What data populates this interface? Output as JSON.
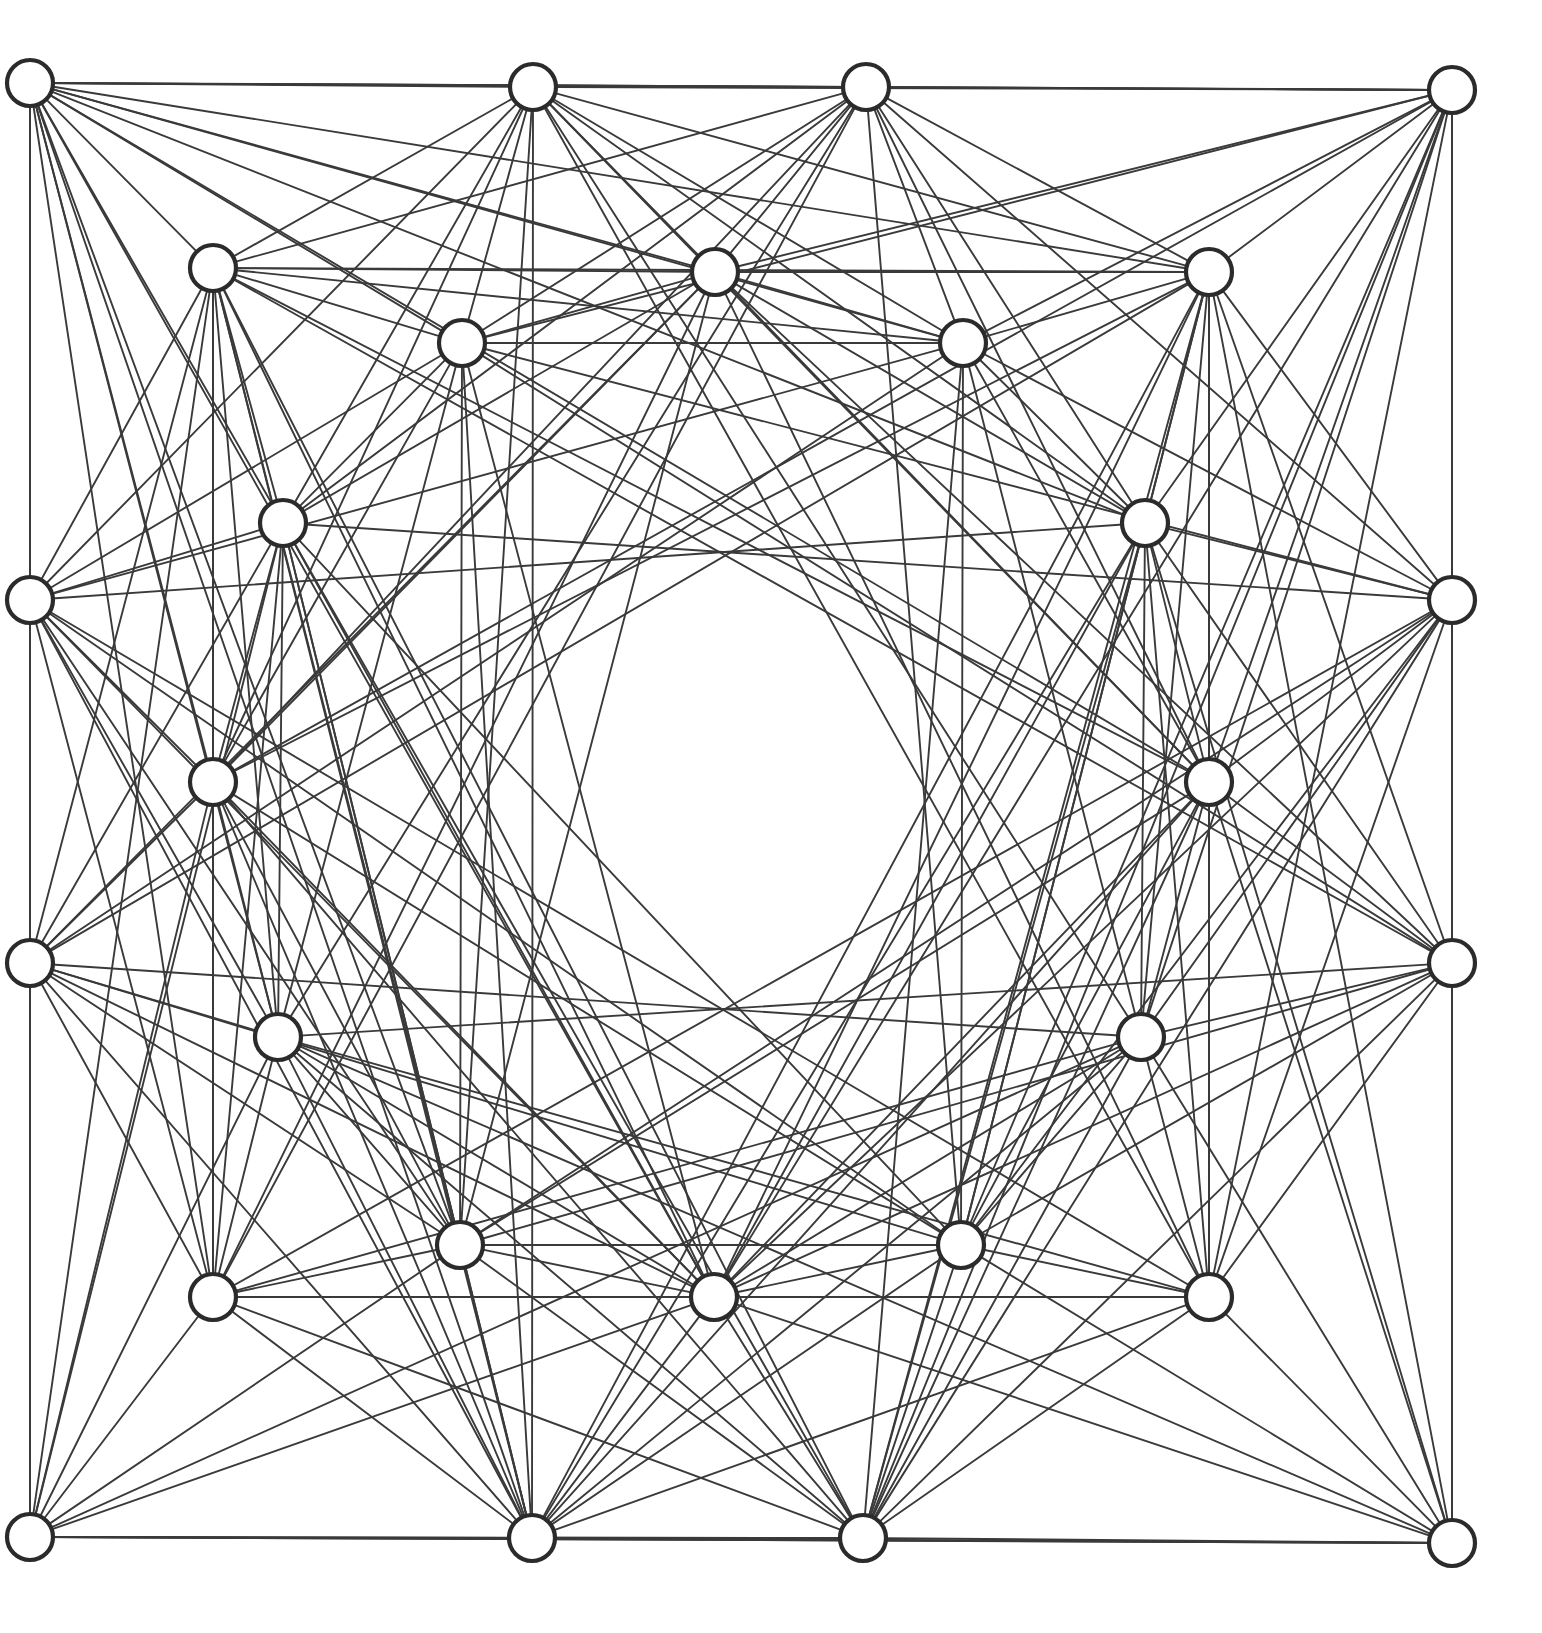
{
  "figure": {
    "canvas": {
      "width": 1542,
      "height": 1633
    },
    "background_color": "#ffffff"
  },
  "style": {
    "edge_color": "#3a3a3a",
    "edge_width": 1.9,
    "node_fill": "#ffffff",
    "node_stroke": "#2b2b2b",
    "node_stroke_width": 4.2,
    "node_radius": 23,
    "boundary_color": "#3a3a3a"
  },
  "chart_data": {
    "type": "scatter",
    "xlabel": "",
    "ylabel": "",
    "xlim": [
      0,
      1542
    ],
    "ylim": [
      0,
      1633
    ],
    "grid": false,
    "legend": "none",
    "node_count": 28,
    "nodes": [
      {
        "id": 0,
        "label": "corner-top-left",
        "x": 30,
        "y": 83,
        "r": 23
      },
      {
        "id": 1,
        "label": "top-edge-left",
        "x": 533,
        "y": 87,
        "r": 23
      },
      {
        "id": 2,
        "label": "top-edge-right",
        "x": 866,
        "y": 87,
        "r": 23
      },
      {
        "id": 3,
        "label": "corner-top-right",
        "x": 1452,
        "y": 90,
        "r": 23
      },
      {
        "id": 4,
        "label": "inner-tl-upper",
        "x": 213,
        "y": 268,
        "r": 23
      },
      {
        "id": 5,
        "label": "inner-top-left-mid",
        "x": 715,
        "y": 272,
        "r": 23
      },
      {
        "id": 6,
        "label": "inner-tr-upper",
        "x": 1209,
        "y": 272,
        "r": 23
      },
      {
        "id": 7,
        "label": "inner-top-left-low",
        "x": 462,
        "y": 343,
        "r": 23
      },
      {
        "id": 8,
        "label": "inner-top-right-low",
        "x": 963,
        "y": 343,
        "r": 23
      },
      {
        "id": 9,
        "label": "mid-upper-left",
        "x": 283,
        "y": 523,
        "r": 23
      },
      {
        "id": 10,
        "label": "mid-upper-right",
        "x": 1145,
        "y": 523,
        "r": 23
      },
      {
        "id": 11,
        "label": "left-edge-upper",
        "x": 30,
        "y": 600,
        "r": 23
      },
      {
        "id": 12,
        "label": "right-edge-upper",
        "x": 1452,
        "y": 600,
        "r": 23
      },
      {
        "id": 13,
        "label": "mid-left",
        "x": 213,
        "y": 782,
        "r": 23
      },
      {
        "id": 14,
        "label": "mid-right",
        "x": 1209,
        "y": 782,
        "r": 23
      },
      {
        "id": 15,
        "label": "left-edge-lower",
        "x": 30,
        "y": 963,
        "r": 23
      },
      {
        "id": 16,
        "label": "right-edge-lower",
        "x": 1452,
        "y": 963,
        "r": 23
      },
      {
        "id": 17,
        "label": "mid-lower-left",
        "x": 278,
        "y": 1037,
        "r": 23
      },
      {
        "id": 18,
        "label": "mid-lower-right",
        "x": 1141,
        "y": 1037,
        "r": 23
      },
      {
        "id": 19,
        "label": "inner-bottom-left",
        "x": 460,
        "y": 1245,
        "r": 23
      },
      {
        "id": 20,
        "label": "inner-bottom-right",
        "x": 961,
        "y": 1245,
        "r": 23
      },
      {
        "id": 21,
        "label": "inner-bl-lower",
        "x": 213,
        "y": 1297,
        "r": 23
      },
      {
        "id": 22,
        "label": "inner-bottom-mid",
        "x": 714,
        "y": 1297,
        "r": 23
      },
      {
        "id": 23,
        "label": "inner-br-lower",
        "x": 1209,
        "y": 1297,
        "r": 23
      },
      {
        "id": 24,
        "label": "corner-bottom-left",
        "x": 30,
        "y": 1537,
        "r": 23
      },
      {
        "id": 25,
        "label": "bottom-edge-left",
        "x": 532,
        "y": 1538,
        "r": 23
      },
      {
        "id": 26,
        "label": "bottom-edge-right",
        "x": 863,
        "y": 1538,
        "r": 23
      },
      {
        "id": 27,
        "label": "corner-bottom-right",
        "x": 1452,
        "y": 1543,
        "r": 23
      }
    ],
    "edges": [
      [
        0,
        1
      ],
      [
        0,
        2
      ],
      [
        0,
        3
      ],
      [
        0,
        4
      ],
      [
        0,
        5
      ],
      [
        0,
        7
      ],
      [
        0,
        9
      ],
      [
        0,
        11
      ],
      [
        0,
        13
      ],
      [
        0,
        15
      ],
      [
        0,
        17
      ],
      [
        0,
        21
      ],
      [
        0,
        24
      ],
      [
        0,
        25
      ],
      [
        0,
        19
      ],
      [
        0,
        10
      ],
      [
        0,
        6
      ],
      [
        0,
        8
      ],
      [
        1,
        2
      ],
      [
        1,
        3
      ],
      [
        1,
        4
      ],
      [
        1,
        5
      ],
      [
        1,
        7
      ],
      [
        1,
        8
      ],
      [
        1,
        9
      ],
      [
        1,
        11
      ],
      [
        1,
        13
      ],
      [
        1,
        19
      ],
      [
        1,
        22
      ],
      [
        1,
        25
      ],
      [
        1,
        20
      ],
      [
        1,
        6
      ],
      [
        2,
        3
      ],
      [
        2,
        5
      ],
      [
        2,
        6
      ],
      [
        2,
        7
      ],
      [
        2,
        8
      ],
      [
        2,
        10
      ],
      [
        2,
        12
      ],
      [
        2,
        14
      ],
      [
        2,
        20
      ],
      [
        2,
        22
      ],
      [
        2,
        26
      ],
      [
        2,
        19
      ],
      [
        2,
        4
      ],
      [
        3,
        6
      ],
      [
        3,
        8
      ],
      [
        3,
        10
      ],
      [
        3,
        12
      ],
      [
        3,
        14
      ],
      [
        3,
        16
      ],
      [
        3,
        18
      ],
      [
        3,
        23
      ],
      [
        3,
        27
      ],
      [
        3,
        26
      ],
      [
        3,
        20
      ],
      [
        3,
        5
      ],
      [
        3,
        7
      ],
      [
        4,
        5
      ],
      [
        4,
        7
      ],
      [
        4,
        9
      ],
      [
        4,
        11
      ],
      [
        4,
        13
      ],
      [
        4,
        15
      ],
      [
        4,
        17
      ],
      [
        4,
        21
      ],
      [
        4,
        24
      ],
      [
        4,
        19
      ],
      [
        4,
        1
      ],
      [
        4,
        6
      ],
      [
        4,
        8
      ],
      [
        4,
        25
      ],
      [
        5,
        6
      ],
      [
        5,
        7
      ],
      [
        5,
        8
      ],
      [
        5,
        9
      ],
      [
        5,
        10
      ],
      [
        5,
        22
      ],
      [
        5,
        19
      ],
      [
        5,
        20
      ],
      [
        5,
        13
      ],
      [
        5,
        14
      ],
      [
        6,
        8
      ],
      [
        6,
        10
      ],
      [
        6,
        12
      ],
      [
        6,
        14
      ],
      [
        6,
        16
      ],
      [
        6,
        18
      ],
      [
        6,
        23
      ],
      [
        6,
        27
      ],
      [
        6,
        20
      ],
      [
        6,
        26
      ],
      [
        7,
        8
      ],
      [
        7,
        9
      ],
      [
        7,
        11
      ],
      [
        7,
        13
      ],
      [
        7,
        19
      ],
      [
        7,
        22
      ],
      [
        7,
        5
      ],
      [
        7,
        17
      ],
      [
        7,
        25
      ],
      [
        8,
        10
      ],
      [
        8,
        12
      ],
      [
        8,
        14
      ],
      [
        8,
        20
      ],
      [
        8,
        22
      ],
      [
        8,
        18
      ],
      [
        8,
        26
      ],
      [
        9,
        11
      ],
      [
        9,
        13
      ],
      [
        9,
        15
      ],
      [
        9,
        17
      ],
      [
        9,
        21
      ],
      [
        9,
        24
      ],
      [
        9,
        19
      ],
      [
        9,
        22
      ],
      [
        9,
        5
      ],
      [
        9,
        7
      ],
      [
        9,
        25
      ],
      [
        10,
        12
      ],
      [
        10,
        14
      ],
      [
        10,
        16
      ],
      [
        10,
        18
      ],
      [
        10,
        23
      ],
      [
        10,
        27
      ],
      [
        10,
        20
      ],
      [
        10,
        22
      ],
      [
        10,
        8
      ],
      [
        10,
        6
      ],
      [
        10,
        26
      ],
      [
        11,
        13
      ],
      [
        11,
        15
      ],
      [
        11,
        17
      ],
      [
        11,
        21
      ],
      [
        11,
        24
      ],
      [
        11,
        9
      ],
      [
        11,
        19
      ],
      [
        11,
        25
      ],
      [
        11,
        4
      ],
      [
        12,
        14
      ],
      [
        12,
        16
      ],
      [
        12,
        18
      ],
      [
        12,
        23
      ],
      [
        12,
        27
      ],
      [
        12,
        10
      ],
      [
        12,
        20
      ],
      [
        12,
        26
      ],
      [
        12,
        6
      ],
      [
        13,
        15
      ],
      [
        13,
        17
      ],
      [
        13,
        21
      ],
      [
        13,
        24
      ],
      [
        13,
        19
      ],
      [
        13,
        22
      ],
      [
        13,
        25
      ],
      [
        13,
        9
      ],
      [
        13,
        11
      ],
      [
        14,
        16
      ],
      [
        14,
        18
      ],
      [
        14,
        23
      ],
      [
        14,
        27
      ],
      [
        14,
        20
      ],
      [
        14,
        22
      ],
      [
        14,
        26
      ],
      [
        14,
        10
      ],
      [
        14,
        12
      ],
      [
        15,
        17
      ],
      [
        15,
        21
      ],
      [
        15,
        24
      ],
      [
        15,
        19
      ],
      [
        15,
        25
      ],
      [
        15,
        13
      ],
      [
        15,
        22
      ],
      [
        16,
        18
      ],
      [
        16,
        23
      ],
      [
        16,
        27
      ],
      [
        16,
        20
      ],
      [
        16,
        26
      ],
      [
        16,
        14
      ],
      [
        16,
        22
      ],
      [
        17,
        19
      ],
      [
        17,
        21
      ],
      [
        17,
        24
      ],
      [
        17,
        25
      ],
      [
        17,
        22
      ],
      [
        17,
        13
      ],
      [
        17,
        15
      ],
      [
        17,
        26
      ],
      [
        18,
        20
      ],
      [
        18,
        23
      ],
      [
        18,
        27
      ],
      [
        18,
        26
      ],
      [
        18,
        22
      ],
      [
        18,
        14
      ],
      [
        18,
        16
      ],
      [
        18,
        25
      ],
      [
        19,
        20
      ],
      [
        19,
        21
      ],
      [
        19,
        22
      ],
      [
        19,
        24
      ],
      [
        19,
        25
      ],
      [
        19,
        26
      ],
      [
        19,
        17
      ],
      [
        20,
        22
      ],
      [
        20,
        23
      ],
      [
        20,
        25
      ],
      [
        20,
        26
      ],
      [
        20,
        27
      ],
      [
        20,
        18
      ],
      [
        21,
        22
      ],
      [
        21,
        24
      ],
      [
        21,
        25
      ],
      [
        21,
        26
      ],
      [
        21,
        19
      ],
      [
        21,
        17
      ],
      [
        22,
        23
      ],
      [
        22,
        25
      ],
      [
        22,
        26
      ],
      [
        22,
        27
      ],
      [
        22,
        20
      ],
      [
        22,
        19
      ],
      [
        23,
        26
      ],
      [
        23,
        27
      ],
      [
        23,
        25
      ],
      [
        23,
        20
      ],
      [
        23,
        18
      ],
      [
        24,
        25
      ],
      [
        24,
        26
      ],
      [
        24,
        27
      ],
      [
        24,
        21
      ],
      [
        24,
        19
      ],
      [
        25,
        26
      ],
      [
        25,
        27
      ],
      [
        25,
        22
      ],
      [
        25,
        20
      ],
      [
        26,
        27
      ],
      [
        26,
        22
      ],
      [
        26,
        19
      ],
      [
        0,
        22
      ],
      [
        3,
        22
      ],
      [
        24,
        22
      ],
      [
        27,
        22
      ],
      [
        11,
        10
      ],
      [
        12,
        9
      ],
      [
        15,
        18
      ],
      [
        16,
        17
      ],
      [
        4,
        14
      ],
      [
        6,
        13
      ],
      [
        21,
        18
      ],
      [
        23,
        17
      ],
      [
        1,
        14
      ],
      [
        2,
        13
      ],
      [
        25,
        18
      ],
      [
        26,
        17
      ],
      [
        5,
        21
      ],
      [
        5,
        23
      ],
      [
        22,
        4
      ],
      [
        22,
        6
      ],
      [
        7,
        12
      ],
      [
        8,
        11
      ],
      [
        19,
        16
      ],
      [
        20,
        15
      ],
      [
        9,
        20
      ],
      [
        10,
        19
      ],
      [
        13,
        26
      ],
      [
        14,
        25
      ],
      [
        1,
        18
      ],
      [
        2,
        17
      ],
      [
        25,
        10
      ],
      [
        26,
        9
      ],
      [
        4,
        20
      ],
      [
        6,
        19
      ],
      [
        21,
        8
      ],
      [
        23,
        7
      ],
      [
        11,
        23
      ],
      [
        12,
        21
      ],
      [
        15,
        6
      ],
      [
        16,
        4
      ],
      [
        0,
        14
      ],
      [
        3,
        13
      ],
      [
        24,
        18
      ],
      [
        27,
        17
      ],
      [
        5,
        15
      ],
      [
        5,
        16
      ],
      [
        22,
        11
      ],
      [
        22,
        12
      ],
      [
        7,
        16
      ],
      [
        8,
        15
      ],
      [
        19,
        12
      ],
      [
        20,
        11
      ],
      [
        9,
        23
      ],
      [
        10,
        21
      ],
      [
        13,
        20
      ],
      [
        14,
        19
      ],
      [
        1,
        10
      ],
      [
        2,
        9
      ],
      [
        25,
        14
      ],
      [
        26,
        13
      ],
      [
        4,
        26
      ],
      [
        6,
        25
      ],
      [
        21,
        2
      ],
      [
        23,
        1
      ]
    ],
    "boundary": {
      "type": "rectangle",
      "note": "Outer frame segments drawn between the corner and edge nodes",
      "points": [
        [
          30,
          83
        ],
        [
          1452,
          90
        ],
        [
          1452,
          1543
        ],
        [
          30,
          1537
        ]
      ]
    },
    "central_void": {
      "shape": "circle",
      "center_x": 741,
      "center_y": 790,
      "radius": 132,
      "note": "No edges pass through this region"
    }
  }
}
